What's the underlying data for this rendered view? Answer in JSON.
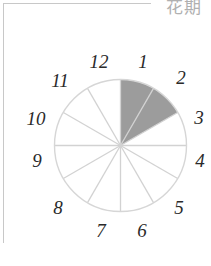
{
  "header": {
    "title": "花期"
  },
  "colors": {
    "highlight_fill": "#9c9c9c",
    "segment_line": "#d2d2d2",
    "outline": "#d6d6d6",
    "label": "#2a2a2a",
    "frame": "#c8c8c8"
  },
  "chart_data": {
    "type": "pie",
    "title": "花期",
    "categories": [
      "1",
      "2",
      "3",
      "4",
      "5",
      "6",
      "7",
      "8",
      "9",
      "10",
      "11",
      "12"
    ],
    "values": [
      1,
      1,
      1,
      1,
      1,
      1,
      1,
      1,
      1,
      1,
      1,
      1
    ],
    "highlighted": [
      1,
      2
    ],
    "series": [
      {
        "name": "flowering",
        "values": [
          1,
          1,
          0,
          0,
          0,
          0,
          0,
          0,
          0,
          0,
          0,
          0
        ]
      }
    ],
    "layout": {
      "start_angle_deg": 0,
      "direction": "clockwise",
      "legend": "none",
      "labels": "outside"
    }
  },
  "labels": [
    {
      "text": "1",
      "x": 143,
      "y": 61
    },
    {
      "text": "2",
      "x": 181,
      "y": 77
    },
    {
      "text": "3",
      "x": 199,
      "y": 117
    },
    {
      "text": "4",
      "x": 200,
      "y": 160
    },
    {
      "text": "5",
      "x": 179,
      "y": 207
    },
    {
      "text": "6",
      "x": 142,
      "y": 230
    },
    {
      "text": "7",
      "x": 101,
      "y": 230
    },
    {
      "text": "8",
      "x": 58,
      "y": 207
    },
    {
      "text": "9",
      "x": 37,
      "y": 160
    },
    {
      "text": "10",
      "x": 36,
      "y": 118
    },
    {
      "text": "11",
      "x": 60,
      "y": 80
    },
    {
      "text": "12",
      "x": 99,
      "y": 61
    }
  ]
}
